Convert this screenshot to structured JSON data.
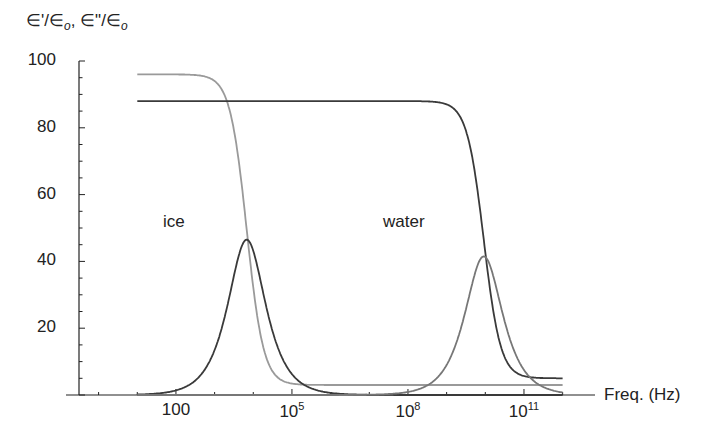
{
  "chart_data": {
    "type": "line",
    "title": "",
    "ylabel": "ε'/ε₀, ε\"/ε₀",
    "xlabel": "Freq. (Hz)",
    "xscale": "log",
    "xlim_log10": [
      -0.5,
      12.8
    ],
    "ylim": [
      0,
      100
    ],
    "yticks": [
      20,
      40,
      60,
      80,
      100
    ],
    "yminor_step": 5,
    "xticks": [
      {
        "log10": 2,
        "label": "100"
      },
      {
        "log10": 5,
        "label": "10",
        "exp": "5"
      },
      {
        "log10": 8,
        "label": "10",
        "exp": "8"
      },
      {
        "log10": 11,
        "label": "10",
        "exp": "11"
      }
    ],
    "grid": false,
    "legend": "none",
    "annotations": [
      {
        "text": "ice",
        "x_px": 163,
        "y_px": 212
      },
      {
        "text": "water",
        "x_px": 383,
        "y_px": 212
      }
    ],
    "x_range_log10": [
      1,
      12
    ],
    "series": [
      {
        "name": "ice ε' (real)",
        "model": "debye_real",
        "eps_s": 96,
        "eps_inf": 3,
        "fc_log10": 3.83,
        "color": "#9a9a9a",
        "points": [
          [
            1,
            96
          ],
          [
            3,
            94.8
          ],
          [
            3.5,
            88.5
          ],
          [
            3.83,
            49.5
          ],
          [
            4.2,
            19.5
          ],
          [
            5,
            5.2
          ],
          [
            6,
            3.1
          ],
          [
            12,
            3
          ]
        ]
      },
      {
        "name": "ice ε\" (imag)",
        "model": "debye_imag",
        "eps_s": 96,
        "eps_inf": 3,
        "fc_log10": 3.83,
        "color": "#3a3a3a",
        "points": [
          [
            1,
            0.1
          ],
          [
            2,
            1.5
          ],
          [
            3,
            6.9
          ],
          [
            3.5,
            19.5
          ],
          [
            3.83,
            46.5
          ],
          [
            4.2,
            19.5
          ],
          [
            5,
            3.1
          ],
          [
            6,
            0.3
          ],
          [
            12,
            0
          ]
        ]
      },
      {
        "name": "water ε' (real)",
        "model": "debye_real",
        "eps_s": 88,
        "eps_inf": 5,
        "fc_log10": 9.96,
        "color": "#3a3a3a",
        "points": [
          [
            1,
            88
          ],
          [
            8,
            88
          ],
          [
            9,
            86.6
          ],
          [
            9.5,
            78.9
          ],
          [
            9.96,
            46.5
          ],
          [
            10.5,
            11.3
          ],
          [
            11,
            5.7
          ],
          [
            12,
            5
          ]
        ]
      },
      {
        "name": "water ε\" (imag)",
        "model": "debye_imag",
        "eps_s": 88,
        "eps_inf": 5,
        "fc_log10": 9.96,
        "color": "#777777",
        "points": [
          [
            1,
            0
          ],
          [
            8,
            0.9
          ],
          [
            9,
            8.9
          ],
          [
            9.5,
            23.1
          ],
          [
            9.96,
            41.5
          ],
          [
            10.5,
            21.2
          ],
          [
            11,
            7.5
          ],
          [
            12,
            0.8
          ]
        ]
      }
    ]
  },
  "axis_px": {
    "x0": 79,
    "y0": 395,
    "y100": 61,
    "decade_px": 38.67,
    "x_log0": 98.6,
    "x_end": 595
  }
}
